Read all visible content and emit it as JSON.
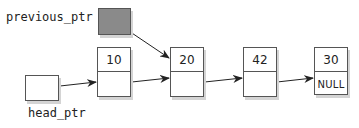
{
  "diagram": {
    "type": "singly-linked-list",
    "pointers": [
      {
        "id": "previous_ptr",
        "label": "previous_ptr",
        "filled": true,
        "points_to": "node-20"
      },
      {
        "id": "head_ptr",
        "label": "head_ptr",
        "filled": false,
        "points_to": "node-10"
      }
    ],
    "nodes": [
      {
        "id": "node-10",
        "value": "10",
        "next": ""
      },
      {
        "id": "node-20",
        "value": "20",
        "next": ""
      },
      {
        "id": "node-42",
        "value": "42",
        "next": ""
      },
      {
        "id": "node-30",
        "value": "30",
        "next": "NULL"
      }
    ],
    "colors": {
      "border": "#555555",
      "filled_pointer": "#8a8a8a",
      "shadow": "#d4d4d4",
      "arrow": "#222222"
    }
  }
}
